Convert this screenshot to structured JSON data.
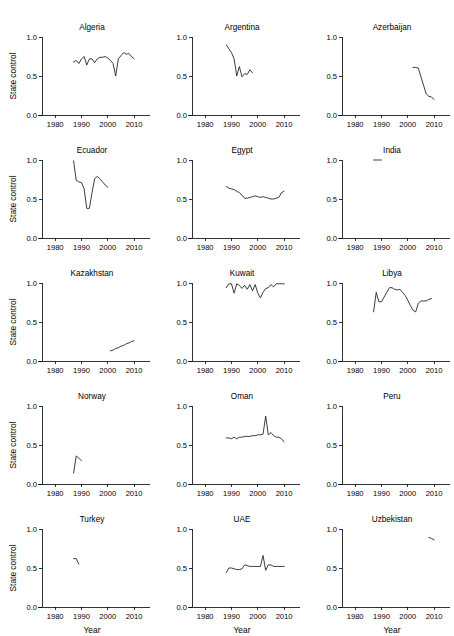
{
  "figure": {
    "cropped_header_text": "",
    "xlabel": "Year",
    "ylabel": "State control",
    "x_ticks": [
      "1980",
      "1990",
      "2000",
      "2010"
    ],
    "y_ticks": [
      "0.0",
      "0.5",
      "1.0"
    ],
    "n_cols": 3,
    "n_rows": 5,
    "line_color": "#1a1a1a",
    "background": "#ffffff"
  },
  "chart_data": {
    "type": "line",
    "title": "",
    "xlabel": "Year",
    "ylabel": "State control",
    "xlim": [
      1975,
      2013
    ],
    "ylim": [
      0.0,
      1.0
    ],
    "x_ticks": [
      1980,
      1990,
      2000,
      2010
    ],
    "y_ticks": [
      0.0,
      0.5,
      1.0
    ],
    "grid": false,
    "legend": "none",
    "layout": "small-multiples 3 columns x 5 rows",
    "panels": [
      {
        "name": "Algeria",
        "row": 1,
        "col": 1,
        "x": [
          1987,
          1988,
          1989,
          1990,
          1991,
          1992,
          1993,
          1994,
          1995,
          1996,
          1997,
          1998,
          1999,
          2000,
          2001,
          2002,
          2003,
          2004,
          2005,
          2006,
          2007,
          2008,
          2009,
          2010
        ],
        "values": [
          0.68,
          0.7,
          0.66,
          0.72,
          0.75,
          0.64,
          0.72,
          0.72,
          0.67,
          0.72,
          0.74,
          0.74,
          0.75,
          0.73,
          0.7,
          0.66,
          0.5,
          0.72,
          0.76,
          0.8,
          0.78,
          0.79,
          0.75,
          0.72
        ]
      },
      {
        "name": "Argentina",
        "row": 1,
        "col": 2,
        "x": [
          1988,
          1989,
          1990,
          1991,
          1992,
          1993,
          1994,
          1995,
          1996,
          1997,
          1998
        ],
        "values": [
          0.9,
          0.85,
          0.8,
          0.72,
          0.5,
          0.62,
          0.49,
          0.53,
          0.52,
          0.58,
          0.54
        ]
      },
      {
        "name": "Azerbaijan",
        "row": 1,
        "col": 3,
        "x": [
          2002,
          2003,
          2004,
          2005,
          2006,
          2007,
          2008,
          2009,
          2010
        ],
        "values": [
          0.61,
          0.61,
          0.6,
          0.49,
          0.38,
          0.27,
          0.24,
          0.23,
          0.2
        ]
      },
      {
        "name": "Ecuador",
        "row": 2,
        "col": 1,
        "x": [
          1987,
          1988,
          1989,
          1990,
          1991,
          1992,
          1993,
          1994,
          1995,
          1996,
          1997,
          1998,
          1999,
          2000
        ],
        "values": [
          0.99,
          0.74,
          0.72,
          0.71,
          0.63,
          0.38,
          0.38,
          0.58,
          0.76,
          0.79,
          0.76,
          0.72,
          0.68,
          0.65
        ]
      },
      {
        "name": "Egypt",
        "row": 2,
        "col": 2,
        "x": [
          1988,
          1989,
          1990,
          1991,
          1992,
          1993,
          1994,
          1995,
          1996,
          1997,
          1998,
          1999,
          2000,
          2001,
          2002,
          2003,
          2004,
          2005,
          2006,
          2007,
          2008,
          2009,
          2010
        ],
        "values": [
          0.66,
          0.64,
          0.63,
          0.62,
          0.6,
          0.58,
          0.55,
          0.51,
          0.51,
          0.52,
          0.53,
          0.54,
          0.53,
          0.52,
          0.53,
          0.52,
          0.51,
          0.5,
          0.5,
          0.51,
          0.52,
          0.58,
          0.6
        ]
      },
      {
        "name": "India",
        "row": 2,
        "col": 3,
        "x": [
          1987,
          1988,
          1989,
          1990
        ],
        "values": [
          1.0,
          1.0,
          1.0,
          1.0
        ]
      },
      {
        "name": "Kazakhstan",
        "row": 3,
        "col": 1,
        "x": [
          2001,
          2002,
          2003,
          2004,
          2005,
          2006,
          2007,
          2008,
          2009,
          2010
        ],
        "values": [
          0.13,
          0.14,
          0.16,
          0.17,
          0.19,
          0.2,
          0.22,
          0.23,
          0.25,
          0.26
        ]
      },
      {
        "name": "Kuwait",
        "row": 3,
        "col": 2,
        "x": [
          1988,
          1989,
          1990,
          1991,
          1992,
          1993,
          1994,
          1995,
          1996,
          1997,
          1998,
          1999,
          2000,
          2001,
          2002,
          2003,
          2004,
          2005,
          2006,
          2007,
          2008,
          2009,
          2010
        ],
        "values": [
          0.94,
          0.99,
          0.99,
          0.87,
          0.99,
          0.97,
          0.93,
          0.97,
          0.92,
          0.98,
          0.9,
          0.98,
          0.87,
          0.81,
          0.88,
          0.93,
          0.94,
          0.98,
          0.95,
          0.99,
          0.99,
          0.99,
          0.99
        ]
      },
      {
        "name": "Libya",
        "row": 3,
        "col": 3,
        "x": [
          1987,
          1988,
          1989,
          1990,
          1991,
          1992,
          1993,
          1994,
          1995,
          1996,
          1997,
          1998,
          1999,
          2000,
          2001,
          2002,
          2003,
          2004,
          2005,
          2006,
          2007,
          2008,
          2009
        ],
        "values": [
          0.63,
          0.88,
          0.76,
          0.76,
          0.82,
          0.88,
          0.94,
          0.94,
          0.92,
          0.91,
          0.92,
          0.88,
          0.84,
          0.78,
          0.71,
          0.65,
          0.63,
          0.74,
          0.77,
          0.77,
          0.77,
          0.79,
          0.8
        ]
      },
      {
        "name": "Norway",
        "row": 4,
        "col": 1,
        "x": [
          1987,
          1988,
          1989,
          1990
        ],
        "values": [
          0.14,
          0.36,
          0.33,
          0.3
        ]
      },
      {
        "name": "Oman",
        "row": 4,
        "col": 2,
        "x": [
          1988,
          1989,
          1990,
          1991,
          1992,
          1993,
          1994,
          1995,
          1996,
          1997,
          1998,
          1999,
          2000,
          2001,
          2002,
          2003,
          2004,
          2005,
          2006,
          2007,
          2008,
          2009,
          2010
        ],
        "values": [
          0.59,
          0.59,
          0.58,
          0.6,
          0.58,
          0.6,
          0.6,
          0.61,
          0.61,
          0.61,
          0.62,
          0.62,
          0.63,
          0.63,
          0.64,
          0.87,
          0.63,
          0.66,
          0.62,
          0.6,
          0.6,
          0.58,
          0.54
        ]
      },
      {
        "name": "Peru",
        "row": 4,
        "col": 3,
        "x": [],
        "values": []
      },
      {
        "name": "Turkey",
        "row": 5,
        "col": 1,
        "x": [
          1987,
          1988,
          1989
        ],
        "values": [
          0.62,
          0.62,
          0.55
        ]
      },
      {
        "name": "UAE",
        "row": 5,
        "col": 2,
        "x": [
          1988,
          1989,
          1990,
          1991,
          1992,
          1993,
          1994,
          1995,
          1996,
          1997,
          1998,
          1999,
          2000,
          2001,
          2002,
          2003,
          2004,
          2005,
          2006,
          2007,
          2008,
          2009,
          2010
        ],
        "values": [
          0.44,
          0.5,
          0.5,
          0.49,
          0.48,
          0.48,
          0.49,
          0.54,
          0.53,
          0.52,
          0.52,
          0.52,
          0.52,
          0.52,
          0.66,
          0.47,
          0.54,
          0.54,
          0.52,
          0.52,
          0.52,
          0.52,
          0.52
        ]
      },
      {
        "name": "Uzbekistan",
        "row": 5,
        "col": 3,
        "x": [
          2008,
          2009,
          2010
        ],
        "values": [
          0.89,
          0.88,
          0.86
        ]
      }
    ]
  }
}
